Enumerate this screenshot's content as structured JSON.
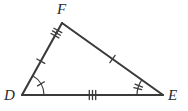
{
  "figure": {
    "kind": "geometry-diagram",
    "shape": "triangle",
    "name": "Triangle DFE",
    "background_color": "#ffffff",
    "stroke_color": "#3a3a3a",
    "label_color": "#2b2b2b",
    "stroke_width": 2.1,
    "tick_stroke_width": 1.3,
    "arc_stroke_width": 1.2,
    "vertices": [
      {
        "id": "F",
        "label": "F",
        "x": 62,
        "y": 23,
        "label_x": 57,
        "label_y": 2
      },
      {
        "id": "D",
        "label": "D",
        "x": 22,
        "y": 95,
        "label_x": 4,
        "label_y": 88
      },
      {
        "id": "E",
        "label": "E",
        "x": 163,
        "y": 95,
        "label_x": 168,
        "label_y": 88
      }
    ],
    "sides": [
      {
        "id": "DF",
        "from": "D",
        "to": "F",
        "tick_groups": [
          {
            "name": "df-single-tick",
            "position": 0.47,
            "count": 1,
            "length": 9,
            "spacing": 3
          },
          {
            "name": "df-triple-tick",
            "position": 0.86,
            "count": 3,
            "length": 9,
            "spacing": 3
          }
        ]
      },
      {
        "id": "FE",
        "from": "F",
        "to": "E",
        "tick_groups": [
          {
            "name": "fe-single-tick",
            "position": 0.5,
            "count": 1,
            "length": 9,
            "spacing": 3
          }
        ]
      },
      {
        "id": "DE",
        "from": "D",
        "to": "E",
        "tick_groups": [
          {
            "name": "de-triple-tick",
            "position": 0.5,
            "count": 3,
            "length": 9,
            "spacing": 3.2
          }
        ]
      }
    ],
    "angle_marks": [
      {
        "id": "angle-D",
        "vertex": "D",
        "radius": 22,
        "arc_count": 1,
        "tick_count": 1,
        "tick_length": 8
      },
      {
        "id": "angle-E",
        "vertex": "E",
        "radius": 26,
        "arc_count": 1,
        "tick_count": 2,
        "tick_length": 8,
        "tick_spacing": 3.2
      }
    ]
  }
}
